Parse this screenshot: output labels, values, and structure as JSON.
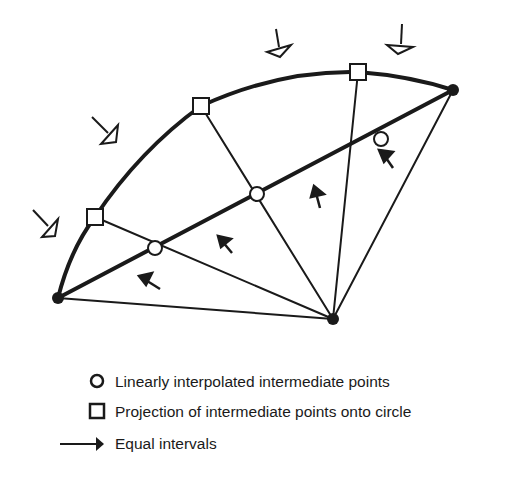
{
  "diagram": {
    "type": "geometric-construction",
    "colors": {
      "stroke": "#1a1a1a",
      "fill_open": "#ffffff",
      "fill_solid": "#1a1a1a"
    },
    "vertices": {
      "left_endpoint": [
        58,
        298
      ],
      "right_endpoint": [
        453,
        90
      ],
      "center": [
        333,
        319
      ]
    },
    "interpolated_points": [
      [
        155,
        248
      ],
      [
        257,
        194
      ],
      [
        381,
        139
      ]
    ],
    "projected_points": [
      [
        95,
        217
      ],
      [
        201,
        106
      ],
      [
        358,
        72
      ]
    ],
    "legend": {
      "items": [
        {
          "symbol": "circle",
          "label": "Linearly interpolated intermediate points"
        },
        {
          "symbol": "square",
          "label": "Projection of intermediate points onto circle"
        },
        {
          "symbol": "arrow",
          "label": "Equal intervals"
        }
      ]
    }
  }
}
